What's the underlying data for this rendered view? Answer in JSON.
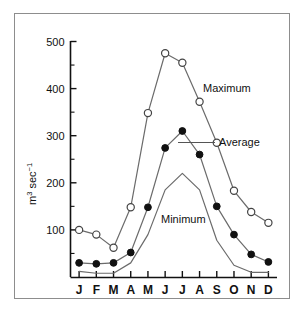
{
  "figure": {
    "frame_visible": true,
    "background_color": "#ffffff",
    "border_color": "#8d8d8d"
  },
  "axes": {
    "y_title_main": "m",
    "y_title_exp": "3",
    "y_title_unit": " sec",
    "y_title_unit_exp": "−1",
    "y_title_full": "m3 sec−1",
    "y_ticks": [
      "100",
      "200",
      "300",
      "400",
      "500"
    ],
    "x_ticks": [
      "J",
      "F",
      "M",
      "A",
      "M",
      "J",
      "J",
      "A",
      "S",
      "O",
      "N",
      "D"
    ]
  },
  "annotations": {
    "maximum_label": "Maximum",
    "average_label": "Average",
    "minimum_label": "Minimum"
  },
  "chart_data": {
    "type": "line",
    "title": "",
    "xlabel": "",
    "ylabel": "m3 sec-1",
    "categories": [
      "J",
      "F",
      "M",
      "A",
      "M",
      "J",
      "J",
      "A",
      "S",
      "O",
      "N",
      "D"
    ],
    "x_tick_labels": [
      "J",
      "F",
      "M",
      "A",
      "M",
      "J",
      "J",
      "A",
      "S",
      "O",
      "N",
      "D"
    ],
    "y_tick_labels": [
      100,
      200,
      300,
      400,
      500
    ],
    "ylim": [
      0,
      510
    ],
    "grid": false,
    "legend_position": "inline-annotations",
    "series": [
      {
        "name": "Maximum",
        "marker": "open-circle",
        "line_color": "#6b6b6b",
        "values": [
          100,
          90,
          62,
          148,
          348,
          475,
          455,
          372,
          285,
          183,
          138,
          115
        ]
      },
      {
        "name": "Average",
        "marker": "filled-circle",
        "line_color": "#6b6b6b",
        "values": [
          30,
          28,
          30,
          52,
          148,
          274,
          310,
          260,
          150,
          90,
          48,
          32
        ]
      },
      {
        "name": "Minimum",
        "marker": "none",
        "line_color": "#6b6b6b",
        "values": [
          12,
          8,
          8,
          30,
          90,
          185,
          220,
          185,
          78,
          25,
          10,
          10
        ]
      }
    ]
  }
}
